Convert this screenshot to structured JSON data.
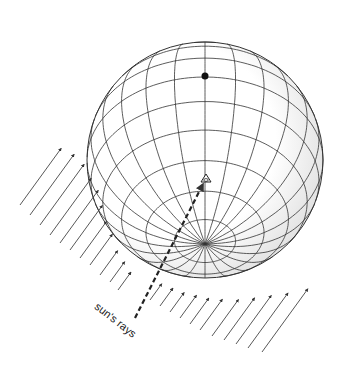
{
  "figure": {
    "label": "sun's rays",
    "colors": {
      "line": "#333333",
      "background": "#ffffff",
      "shade": "#bdbdbd"
    },
    "sphere": {
      "cx": 205,
      "cy": 160,
      "r": 118,
      "pole": [
        205,
        72
      ],
      "meridians": 24,
      "parallels": 12
    },
    "observer_symbol": "eye-icon"
  }
}
